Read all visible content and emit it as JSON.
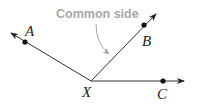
{
  "diagram": {
    "callout": {
      "text": "Common side",
      "color": "#a8a8a8"
    },
    "vertex": {
      "label": "X"
    },
    "points": [
      {
        "label": "A"
      },
      {
        "label": "B"
      },
      {
        "label": "C"
      }
    ],
    "colors": {
      "line": "#333333",
      "point": "#111111",
      "callout_arrow": "#a8a8a8"
    }
  }
}
